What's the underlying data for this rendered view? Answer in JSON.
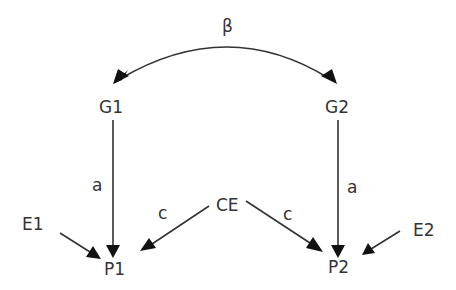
{
  "diagram": {
    "nodes": {
      "g1": "G1",
      "g2": "G2",
      "ce": "CE",
      "e1": "E1",
      "e2": "E2",
      "p1": "P1",
      "p2": "P2"
    },
    "edge_labels": {
      "beta": "β",
      "a_left": "a",
      "a_right": "a",
      "c_left": "c",
      "c_right": "c"
    },
    "edges": [
      {
        "from": "G1",
        "to": "G2",
        "label": "β",
        "type": "bidirectional-curve"
      },
      {
        "from": "G1",
        "to": "P1",
        "label": "a"
      },
      {
        "from": "G2",
        "to": "P2",
        "label": "a"
      },
      {
        "from": "CE",
        "to": "P1",
        "label": "c"
      },
      {
        "from": "CE",
        "to": "P2",
        "label": "c"
      },
      {
        "from": "E1",
        "to": "P1",
        "label": ""
      },
      {
        "from": "E2",
        "to": "P2",
        "label": ""
      }
    ]
  }
}
